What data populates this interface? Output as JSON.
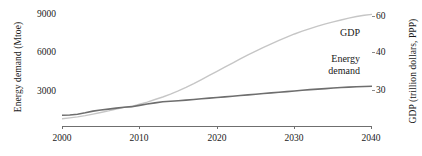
{
  "chart_data": {
    "type": "line",
    "title": "",
    "xlabel": "",
    "ylabel": "Energy demand (Mtoe)",
    "y2label": "GDP (trillion dollars, PPP)",
    "xlim": [
      2000,
      2040
    ],
    "ylim": [
      1200,
      9900
    ],
    "y2lim": [
      26,
      62
    ],
    "grid": false,
    "legend_position": "inline-right",
    "x": [
      2000,
      2001,
      2002,
      2003,
      2004,
      2005,
      2006,
      2007,
      2008,
      2009,
      2010,
      2011,
      2012,
      2013,
      2014,
      2015,
      2016,
      2017,
      2018,
      2019,
      2020,
      2021,
      2022,
      2023,
      2024,
      2025,
      2026,
      2027,
      2028,
      2029,
      2030,
      2031,
      2032,
      2033,
      2034,
      2035,
      2036,
      2037,
      2038,
      2039,
      2040
    ],
    "xticks": [
      2000,
      2010,
      2020,
      2030,
      2040
    ],
    "xticklabels": [
      "2000",
      "2010",
      "2020",
      "2030",
      "2040"
    ],
    "yticks": [
      3000,
      6000,
      9000
    ],
    "yticklabels": [
      "3000",
      "6000",
      "9000"
    ],
    "y2ticks": [
      30,
      40,
      60
    ],
    "y2ticklabels": [
      "30",
      "40",
      "60"
    ],
    "series": [
      {
        "name": "Energy demand",
        "label": "Energy demand",
        "axis": "left",
        "color": "#6e6e6e",
        "linewidth": 1.6,
        "values": [
          1720,
          1735,
          1790,
          1900,
          2030,
          2110,
          2180,
          2260,
          2330,
          2370,
          2470,
          2570,
          2660,
          2740,
          2780,
          2820,
          2870,
          2920,
          2970,
          3020,
          3070,
          3120,
          3170,
          3220,
          3270,
          3320,
          3370,
          3420,
          3470,
          3520,
          3570,
          3620,
          3670,
          3710,
          3750,
          3790,
          3830,
          3860,
          3890,
          3910,
          3930
        ]
      },
      {
        "name": "GDP",
        "label": "GDP",
        "axis": "right",
        "color": "#c6c6c6",
        "linewidth": 1.4,
        "values": [
          27.0,
          27.3,
          27.6,
          28.0,
          28.5,
          29.0,
          29.5,
          30.1,
          30.6,
          30.9,
          31.6,
          32.3,
          33.1,
          33.9,
          34.8,
          35.8,
          36.9,
          38.1,
          39.4,
          40.7,
          42.0,
          43.3,
          44.6,
          45.9,
          47.2,
          48.4,
          49.6,
          50.7,
          51.8,
          52.8,
          53.8,
          54.7,
          55.5,
          56.3,
          57.0,
          57.6,
          58.2,
          58.8,
          59.3,
          59.7,
          60.0
        ]
      }
    ],
    "annotations": [
      {
        "text": "GDP",
        "x": 2033,
        "y2": 52
      },
      {
        "text": "Energy demand",
        "x": 2034,
        "y2": 41
      }
    ]
  },
  "labels": {
    "y_axis_title": "Energy demand (Mtoe)",
    "y2_axis_title": "GDP (trillion dollars, PPP)",
    "series_gdp": "GDP",
    "series_energy_line1": "Energy",
    "series_energy_line2": "demand"
  },
  "ticks": {
    "y_left": [
      "9000",
      "6000",
      "3000"
    ],
    "y_right": [
      "60",
      "40",
      "30"
    ],
    "x": [
      "2000",
      "2010",
      "2020",
      "2030",
      "2040"
    ]
  },
  "colors": {
    "energy_line": "#6e6e6e",
    "gdp_line": "#c6c6c6",
    "axis": "#6f6f6f",
    "text": "#1a1a1a",
    "background": "#ffffff"
  }
}
